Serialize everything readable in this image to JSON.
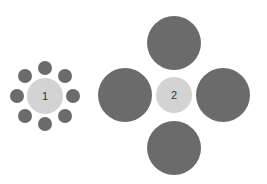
{
  "diagram": {
    "type": "ebbinghaus-illusion",
    "colors": {
      "center": "#d3d3d3",
      "surround": "#6b6b6b",
      "label": "#333333",
      "background": "#ffffff"
    },
    "groups": [
      {
        "label": "1",
        "center": {
          "cx": 45,
          "cy": 96,
          "r": 18
        },
        "surround": [
          {
            "cx": 45,
            "cy": 68,
            "r": 7
          },
          {
            "cx": 65,
            "cy": 76,
            "r": 7
          },
          {
            "cx": 73,
            "cy": 96,
            "r": 7
          },
          {
            "cx": 65,
            "cy": 116,
            "r": 7
          },
          {
            "cx": 45,
            "cy": 124,
            "r": 7
          },
          {
            "cx": 25,
            "cy": 116,
            "r": 7
          },
          {
            "cx": 17,
            "cy": 96,
            "r": 7
          },
          {
            "cx": 25,
            "cy": 76,
            "r": 7
          }
        ]
      },
      {
        "label": "2",
        "center": {
          "cx": 174,
          "cy": 95,
          "r": 18
        },
        "surround": [
          {
            "cx": 174,
            "cy": 43,
            "r": 27
          },
          {
            "cx": 223,
            "cy": 95,
            "r": 27
          },
          {
            "cx": 174,
            "cy": 148,
            "r": 27
          },
          {
            "cx": 125,
            "cy": 95,
            "r": 27
          }
        ]
      }
    ]
  }
}
